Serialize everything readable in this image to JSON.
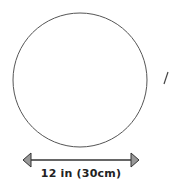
{
  "diagram": {
    "shape": "circle",
    "dimension_label": "12 in (30cm)",
    "colors": {
      "stroke": "#555555",
      "arrowhead_fill": "#999999",
      "arrowhead_stroke": "#333333",
      "text": "#222222"
    }
  }
}
